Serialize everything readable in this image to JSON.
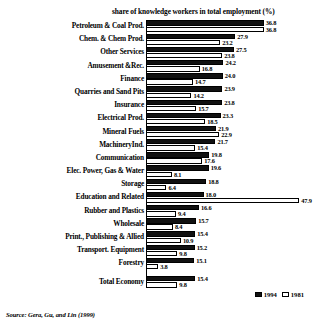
{
  "chart_data": {
    "type": "bar",
    "orientation": "horizontal",
    "title": "share of knowledge workers in total employment (%)",
    "xlabel": "",
    "ylabel": "",
    "xlim": [
      0,
      50
    ],
    "grid": false,
    "legend_position": "bottom-right",
    "categories": [
      "Petroleum & Coal Prod.",
      "Chem. & Chem Prod.",
      "Other Services",
      "Amusement &Rec.",
      "Finance",
      "Quarries and Sand Pits",
      "Insurance",
      "Electrical Prod.",
      "Mineral Fuels",
      "MachineryInd.",
      "Communication",
      "Elec. Power, Gas & Water",
      "Storage",
      "Education and Related",
      "Rubber and Plastics",
      "Wholesale",
      "Print., Publishing & Allied",
      "Transport. Equipment",
      "Forestry",
      "Total Economy"
    ],
    "series": [
      {
        "name": "1994",
        "color": "#111111",
        "values": [
          36.8,
          27.9,
          27.5,
          24.2,
          24.0,
          23.9,
          23.8,
          23.3,
          21.9,
          21.7,
          19.8,
          19.6,
          18.8,
          18.0,
          16.6,
          15.7,
          15.4,
          15.2,
          15.1,
          15.4
        ]
      },
      {
        "name": "1981",
        "color": "#ffffff",
        "values": [
          36.8,
          23.2,
          23.8,
          16.8,
          14.7,
          14.2,
          15.7,
          18.5,
          22.9,
          15.4,
          17.6,
          8.1,
          6.4,
          47.9,
          9.4,
          8.4,
          10.9,
          9.8,
          3.8,
          9.8
        ]
      }
    ],
    "source": "Source: Gera, Gu, and Lin (1999)"
  },
  "legend": {
    "items": [
      {
        "label": "1994",
        "style": "filled"
      },
      {
        "label": "1981",
        "style": "hollow"
      }
    ]
  }
}
